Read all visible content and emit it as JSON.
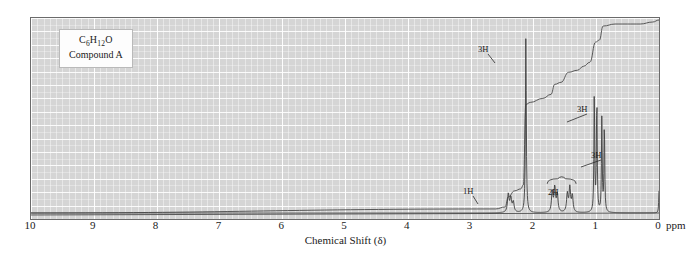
{
  "figure": {
    "label_box": {
      "formula_prefix": "C",
      "formula": "C6H12O",
      "compound": "Compound A"
    },
    "xlabel": "Chemical Shift (δ)",
    "unit_label": "ppm",
    "background_color": "#d5d5d5",
    "trace_color": "#4a4a4a",
    "frame_color": "#6b6b6b"
  },
  "chart_data": {
    "type": "line",
    "title": "",
    "subtitle": "",
    "xlabel": "Chemical Shift (δ)",
    "ylabel": "",
    "xlim": [
      10,
      0
    ],
    "ylim": [
      0,
      100
    ],
    "grid": true,
    "legend": "none",
    "axis_ticks": [
      10,
      9,
      8,
      7,
      6,
      5,
      4,
      3,
      2,
      1,
      0
    ],
    "unit": "ppm",
    "annotations": [
      {
        "text": "3H",
        "shift": 2.1,
        "label_x": 478,
        "label_y": 44,
        "leader_x2": 494,
        "leader_y2": 62
      },
      {
        "text": "3H",
        "shift": 1.0,
        "label_x": 577,
        "label_y": 104,
        "leader_x2": 566,
        "leader_y2": 121
      },
      {
        "text": "3H",
        "shift": 0.9,
        "label_x": 591,
        "label_y": 150,
        "leader_x2": 580,
        "leader_y2": 166
      },
      {
        "text": "1H",
        "shift": 2.4,
        "label_x": 463,
        "label_y": 186,
        "leader_x2": 477,
        "leader_y2": 203
      },
      {
        "text": "2H",
        "shift": 1.6,
        "label_x": 548,
        "label_y": 187,
        "leader_x2": 548,
        "leader_y2": 187
      }
    ],
    "series": [
      {
        "name": "spectrum",
        "description": "1H NMR absorption trace",
        "peaks": [
          {
            "shift": 2.4,
            "height": 9,
            "width": 0.03,
            "multiplicity": "multiplet",
            "integration": "1H"
          },
          {
            "shift": 2.36,
            "height": 7,
            "width": 0.03,
            "multiplicity": "multiplet",
            "integration": "1H"
          },
          {
            "shift": 2.32,
            "height": 5,
            "width": 0.03,
            "multiplicity": "multiplet",
            "integration": "1H"
          },
          {
            "shift": 2.12,
            "height": 88,
            "width": 0.016,
            "multiplicity": "singlet",
            "integration": "3H"
          },
          {
            "shift": 1.7,
            "height": 10,
            "width": 0.028,
            "multiplicity": "multiplet",
            "integration": "2H"
          },
          {
            "shift": 1.66,
            "height": 12,
            "width": 0.028,
            "multiplicity": "multiplet",
            "integration": "2H"
          },
          {
            "shift": 1.62,
            "height": 9,
            "width": 0.028,
            "multiplicity": "multiplet",
            "integration": "2H"
          },
          {
            "shift": 1.46,
            "height": 9,
            "width": 0.028,
            "multiplicity": "multiplet",
            "integration": "2H"
          },
          {
            "shift": 1.42,
            "height": 12,
            "width": 0.028,
            "multiplicity": "multiplet",
            "integration": "2H"
          },
          {
            "shift": 1.38,
            "height": 8,
            "width": 0.028,
            "multiplicity": "multiplet",
            "integration": "2H"
          },
          {
            "shift": 1.03,
            "height": 60,
            "width": 0.014,
            "multiplicity": "doublet",
            "integration": "3H"
          },
          {
            "shift": 0.99,
            "height": 58,
            "width": 0.014,
            "multiplicity": "doublet",
            "integration": "3H"
          },
          {
            "shift": 0.91,
            "height": 47,
            "width": 0.014,
            "multiplicity": "doublet",
            "integration": "3H"
          },
          {
            "shift": 0.87,
            "height": 45,
            "width": 0.014,
            "multiplicity": "doublet",
            "integration": "3H"
          },
          {
            "shift": 0.0,
            "height": 11,
            "width": 0.012,
            "multiplicity": "singlet",
            "integration": "TMS"
          }
        ]
      },
      {
        "name": "integration",
        "description": "stepped integral curve, rises left to right",
        "points": [
          {
            "shift": 10.0,
            "value": 3
          },
          {
            "shift": 2.6,
            "value": 5
          },
          {
            "shift": 2.45,
            "value": 6
          },
          {
            "shift": 2.4,
            "value": 11
          },
          {
            "shift": 2.3,
            "value": 14
          },
          {
            "shift": 2.2,
            "value": 15
          },
          {
            "shift": 2.16,
            "value": 17
          },
          {
            "shift": 2.12,
            "value": 57
          },
          {
            "shift": 2.05,
            "value": 58
          },
          {
            "shift": 1.85,
            "value": 60
          },
          {
            "shift": 1.72,
            "value": 62
          },
          {
            "shift": 1.66,
            "value": 67
          },
          {
            "shift": 1.56,
            "value": 68
          },
          {
            "shift": 1.44,
            "value": 73
          },
          {
            "shift": 1.3,
            "value": 74
          },
          {
            "shift": 1.2,
            "value": 76
          },
          {
            "shift": 1.1,
            "value": 78
          },
          {
            "shift": 1.01,
            "value": 88
          },
          {
            "shift": 0.95,
            "value": 89
          },
          {
            "shift": 0.89,
            "value": 96
          },
          {
            "shift": 0.7,
            "value": 97
          },
          {
            "shift": 0.3,
            "value": 97
          },
          {
            "shift": 0.1,
            "value": 98
          },
          {
            "shift": 0.0,
            "value": 99
          },
          {
            "shift": -0.4,
            "value": 99
          }
        ]
      },
      {
        "name": "baseline",
        "description": "flat baseline skimming bottom of plot",
        "points": [
          {
            "shift": 10.0,
            "value": 2
          },
          {
            "shift": 0.0,
            "value": 3
          }
        ]
      }
    ]
  }
}
